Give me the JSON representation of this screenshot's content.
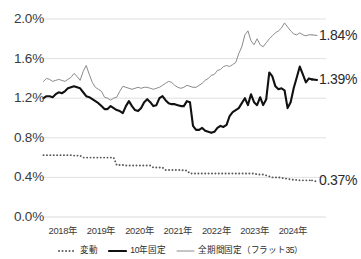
{
  "chart_data": {
    "type": "line",
    "title": "",
    "subtitle": "",
    "xlabel": "",
    "ylabel": "",
    "ylim": [
      0.0,
      2.0
    ],
    "ytick_labels": [
      "2.0%",
      "1.6%",
      "1.2%",
      "0.8%",
      "0.4%",
      "0.0%"
    ],
    "ytick_values": [
      2.0,
      1.6,
      1.2,
      0.8,
      0.4,
      0.0
    ],
    "xtick_labels": [
      "2018年",
      "2019年",
      "2020年",
      "2021年",
      "2022年",
      "2023年",
      "2024年"
    ],
    "xtick_values": [
      2018,
      2019,
      2020,
      2021,
      2022,
      2023,
      2024
    ],
    "grid": true,
    "legend_position": "bottom",
    "x_unit": "month",
    "x_start": "2018-01",
    "x_end": "2024-07",
    "series": [
      {
        "name": "変動",
        "style": "dotted",
        "color": "#5a5a5a",
        "end_label": "0.37%",
        "end_value": 0.37,
        "values": [
          0.625,
          0.625,
          0.625,
          0.625,
          0.625,
          0.625,
          0.625,
          0.625,
          0.625,
          0.625,
          0.62,
          0.62,
          0.62,
          0.6,
          0.6,
          0.6,
          0.6,
          0.6,
          0.6,
          0.6,
          0.6,
          0.6,
          0.6,
          0.6,
          0.525,
          0.525,
          0.525,
          0.52,
          0.52,
          0.52,
          0.52,
          0.52,
          0.52,
          0.52,
          0.52,
          0.52,
          0.5,
          0.5,
          0.5,
          0.5,
          0.475,
          0.475,
          0.475,
          0.475,
          0.475,
          0.475,
          0.47,
          0.47,
          0.44,
          0.44,
          0.44,
          0.44,
          0.44,
          0.44,
          0.44,
          0.44,
          0.44,
          0.44,
          0.44,
          0.44,
          0.44,
          0.44,
          0.44,
          0.44,
          0.44,
          0.44,
          0.44,
          0.44,
          0.44,
          0.44,
          0.43,
          0.43,
          0.43,
          0.42,
          0.41,
          0.4,
          0.4,
          0.4,
          0.395,
          0.39,
          0.385,
          0.38,
          0.375,
          0.375,
          0.37,
          0.37,
          0.37,
          0.37,
          0.37
        ]
      },
      {
        "name": "10年固定",
        "style": "solid-thick",
        "color": "#111111",
        "end_label": "1.39%",
        "end_value": 1.39,
        "values": [
          1.2,
          1.22,
          1.22,
          1.21,
          1.24,
          1.26,
          1.25,
          1.27,
          1.3,
          1.31,
          1.32,
          1.31,
          1.3,
          1.26,
          1.22,
          1.21,
          1.19,
          1.17,
          1.15,
          1.12,
          1.09,
          1.09,
          1.12,
          1.1,
          1.08,
          1.07,
          1.05,
          1.12,
          1.17,
          1.12,
          1.08,
          1.07,
          1.1,
          1.16,
          1.19,
          1.16,
          1.12,
          1.13,
          1.2,
          1.22,
          1.18,
          1.15,
          1.14,
          1.14,
          1.13,
          1.12,
          1.12,
          1.17,
          1.16,
          0.92,
          0.88,
          0.88,
          0.9,
          0.87,
          0.86,
          0.85,
          0.86,
          0.9,
          0.92,
          0.91,
          0.93,
          1.02,
          1.06,
          1.08,
          1.1,
          1.15,
          1.2,
          1.13,
          1.24,
          1.16,
          1.13,
          1.21,
          1.13,
          1.19,
          1.46,
          1.42,
          1.32,
          1.29,
          1.3,
          1.28,
          1.1,
          1.16,
          1.3,
          1.41,
          1.52,
          1.44,
          1.36,
          1.4,
          1.39
        ]
      },
      {
        "name": "全期間固定（フラット35）",
        "style": "solid-thin",
        "color": "#8a8a8a",
        "end_label": "1.84%",
        "end_value": 1.84,
        "values": [
          1.37,
          1.4,
          1.39,
          1.37,
          1.38,
          1.39,
          1.38,
          1.37,
          1.39,
          1.41,
          1.45,
          1.42,
          1.38,
          1.47,
          1.53,
          1.44,
          1.36,
          1.31,
          1.29,
          1.27,
          1.21,
          1.2,
          1.18,
          1.2,
          1.21,
          1.27,
          1.32,
          1.31,
          1.3,
          1.29,
          1.3,
          1.31,
          1.3,
          1.31,
          1.31,
          1.3,
          1.29,
          1.3,
          1.31,
          1.33,
          1.35,
          1.37,
          1.36,
          1.33,
          1.31,
          1.3,
          1.31,
          1.33,
          1.32,
          1.31,
          1.31,
          1.33,
          1.35,
          1.38,
          1.4,
          1.43,
          1.44,
          1.48,
          1.49,
          1.52,
          1.53,
          1.52,
          1.54,
          1.56,
          1.65,
          1.72,
          1.84,
          1.88,
          1.78,
          1.74,
          1.8,
          1.74,
          1.72,
          1.76,
          1.8,
          1.83,
          1.86,
          1.88,
          1.91,
          1.96,
          1.92,
          1.88,
          1.85,
          1.84,
          1.86,
          1.84,
          1.83,
          1.84,
          1.84
        ]
      }
    ]
  },
  "axis": {
    "yticks": [
      {
        "label": "2.0%",
        "value": 2.0
      },
      {
        "label": "1.6%",
        "value": 1.6
      },
      {
        "label": "1.2%",
        "value": 1.2
      },
      {
        "label": "0.8%",
        "value": 0.8
      },
      {
        "label": "0.4%",
        "value": 0.4
      },
      {
        "label": "0.0%",
        "value": 0.0
      }
    ],
    "xticks": [
      {
        "label": "2018年"
      },
      {
        "label": "2019年"
      },
      {
        "label": "2020年"
      },
      {
        "label": "2021年"
      },
      {
        "label": "2022年"
      },
      {
        "label": "2023年"
      },
      {
        "label": "2024年"
      }
    ]
  },
  "callouts": [
    {
      "label": "1.84%",
      "series": "全期間固定（フラット35）"
    },
    {
      "label": "1.39%",
      "series": "10年固定"
    },
    {
      "label": "0.37%",
      "series": "変動"
    }
  ],
  "legend": {
    "items": [
      {
        "label": "変動",
        "style": "dotted",
        "color": "#5a5a5a"
      },
      {
        "label": "10年固定",
        "style": "solid-thick",
        "color": "#111111"
      },
      {
        "label": "全期間固定（フラット35）",
        "style": "solid-thin",
        "color": "#8a8a8a"
      }
    ]
  },
  "colors": {
    "grid": "#dcdcdc",
    "text": "#2b2b2b",
    "background": "#ffffff"
  }
}
